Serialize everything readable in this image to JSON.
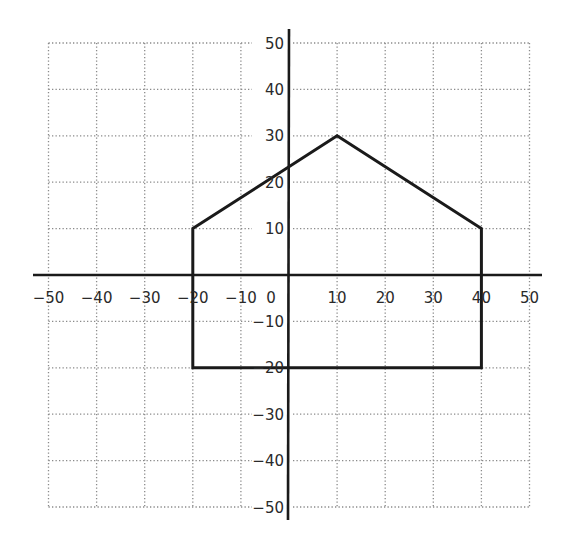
{
  "chart_data": {
    "type": "line",
    "title": "",
    "xlabel": "",
    "ylabel": "",
    "xlim": [
      -50,
      50
    ],
    "ylim": [
      -50,
      50
    ],
    "grid": true,
    "grid_style": "dotted",
    "x_ticks": [
      -50,
      -40,
      -30,
      -20,
      -10,
      0,
      10,
      20,
      30,
      40,
      50
    ],
    "y_ticks": [
      50,
      40,
      30,
      20,
      10,
      -10,
      -20,
      -30,
      -40,
      -50
    ],
    "x_tick_labels": [
      "−50",
      "−40",
      "−30",
      "−20",
      "−10",
      "0",
      "10",
      "20",
      "30",
      "40",
      "50"
    ],
    "y_tick_labels": [
      "50",
      "40",
      "30",
      "20",
      "10",
      "−10",
      "−20",
      "−30",
      "−40",
      "−50"
    ],
    "series": [
      {
        "name": "polygon",
        "closed": true,
        "points": [
          {
            "x": -20,
            "y": 10
          },
          {
            "x": 10,
            "y": 30
          },
          {
            "x": 40,
            "y": 10
          },
          {
            "x": 40,
            "y": -20
          },
          {
            "x": -20,
            "y": -20
          }
        ]
      }
    ],
    "colors": {
      "axis": "#1a1a1a",
      "polygon": "#1a1a1a",
      "grid": "#8a8a8a"
    }
  }
}
